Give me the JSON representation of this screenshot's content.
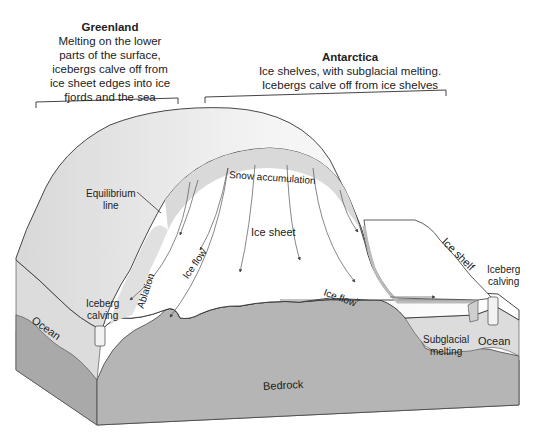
{
  "diagram": {
    "type": "3d-block-diagram",
    "colors": {
      "ice_surface": "#f2f2f2",
      "ice_side_shade": "#e4e4e4",
      "accumulation_band": "#d9d9d9",
      "bedrock": "#b3b3b3",
      "bedrock_dark": "#a6a6a6",
      "ocean": "#dedede",
      "outline": "#333333"
    },
    "captions": {
      "greenland": {
        "title": "Greenland",
        "lines": [
          "Melting on the lower",
          "parts of the surface,",
          "icebergs calve off from",
          "ice sheet edges into ice",
          "fjords and the sea"
        ]
      },
      "antarctica": {
        "title": "Antarctica",
        "lines": [
          "Ice shelves, with subglacial melting.",
          "Icebergs calve off from ice shelves"
        ]
      }
    },
    "labels": {
      "equilibrium_line": [
        "Equilibrium",
        "line"
      ],
      "snow_accumulation": "Snow accumulation",
      "ice_sheet": "Ice sheet",
      "ice_flow_left": "Ice flow",
      "ice_flow_right": "Ice flow",
      "ablation": "Ablation",
      "iceberg_calving_left": [
        "Iceberg",
        "calving"
      ],
      "iceberg_calving_right": [
        "Iceberg",
        "calving"
      ],
      "ocean_left": "Ocean",
      "ocean_right": "Ocean",
      "ice_shelf": "Ice shelf",
      "subglacial_melting": [
        "Subglacial",
        "melting"
      ],
      "bedrock": "Bedrock"
    }
  }
}
